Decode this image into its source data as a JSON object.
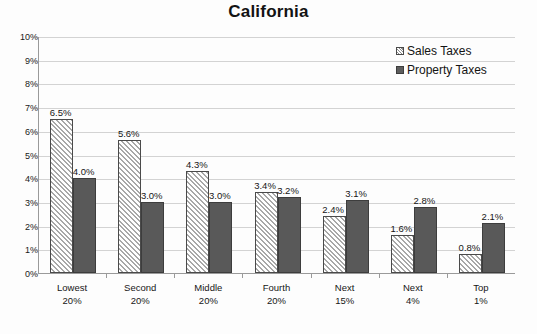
{
  "chart_data": {
    "type": "bar",
    "title": "California",
    "xlabel": "",
    "ylabel": "",
    "ylim": [
      0,
      10
    ],
    "ytick_labels": [
      "10%",
      "9%",
      "8%",
      "7%",
      "6%",
      "5%",
      "4%",
      "3%",
      "2%",
      "1%",
      "0%"
    ],
    "grid": true,
    "legend_position": "top-right",
    "categories": [
      {
        "line1": "Lowest",
        "line2": "20%"
      },
      {
        "line1": "Second",
        "line2": "20%"
      },
      {
        "line1": "Middle",
        "line2": "20%"
      },
      {
        "line1": "Fourth",
        "line2": "20%"
      },
      {
        "line1": "Next",
        "line2": "15%"
      },
      {
        "line1": "Next",
        "line2": "4%"
      },
      {
        "line1": "Top",
        "line2": "1%"
      }
    ],
    "series": [
      {
        "name": "Sales Taxes",
        "fill": "diagonal-hatch",
        "color": "#a8a8a8",
        "values": [
          6.5,
          5.6,
          4.3,
          3.4,
          2.4,
          1.6,
          0.8
        ],
        "labels": [
          "6.5%",
          "5.6%",
          "4.3%",
          "3.4%",
          "2.4%",
          "1.6%",
          "0.8%"
        ]
      },
      {
        "name": "Property Taxes",
        "fill": "solid",
        "color": "#595959",
        "values": [
          4.0,
          3.0,
          3.0,
          3.2,
          3.1,
          2.8,
          2.1
        ],
        "labels": [
          "4.0%",
          "3.0%",
          "3.0%",
          "3.2%",
          "3.1%",
          "2.8%",
          "2.1%"
        ]
      }
    ]
  },
  "colors": {
    "background": "#fdfdfd",
    "axis": "#9a9a9a",
    "gridline": "#d3d3d3",
    "text": "#161616",
    "sales_taxes": "#a8a8a8",
    "property_taxes": "#595959"
  }
}
